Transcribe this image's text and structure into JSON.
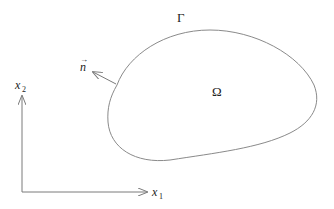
{
  "diagram": {
    "domain_label": "Ω",
    "boundary_label": "Γ",
    "normal_label": "n",
    "normal_vector_mark": "→",
    "x_axis": {
      "label": "x",
      "subscript": "1"
    },
    "y_axis": {
      "label": "x",
      "subscript": "2"
    },
    "colors": {
      "stroke": "#7a7a7a",
      "text": "#222222",
      "background": "#ffffff"
    }
  }
}
